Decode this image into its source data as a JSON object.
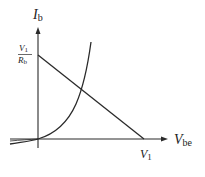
{
  "diagram": {
    "type": "transistor-input-characteristic-with-load-line",
    "y_axis": {
      "label_main": "I",
      "label_sub": "b"
    },
    "x_axis": {
      "label_main": "V",
      "label_sub": "be"
    },
    "y_intercept": {
      "num_main": "V",
      "num_sub": "1",
      "den_main": "R",
      "den_sub": "b"
    },
    "x_intercept": {
      "label_main": "V",
      "label_sub": "1"
    },
    "colors": {
      "line": "#2a2a2a",
      "background": "#ffffff"
    }
  }
}
